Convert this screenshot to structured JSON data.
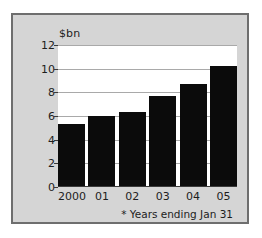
{
  "chart_data": {
    "type": "bar",
    "title": "",
    "subtitle": "",
    "xlabel": "",
    "ylabel": "$bn",
    "categories": [
      "2000",
      "01",
      "02",
      "03",
      "04",
      "05"
    ],
    "values": [
      5.3,
      6.0,
      6.3,
      7.7,
      8.7,
      10.2
    ],
    "series": [
      {
        "name": "",
        "values": [
          5.3,
          6.0,
          6.3,
          7.7,
          8.7,
          10.2
        ]
      }
    ],
    "ylim": [
      0,
      12
    ],
    "yticks": [
      0,
      2,
      4,
      6,
      8,
      10,
      12
    ],
    "ytick_labels": [
      "0",
      "2",
      "4",
      "6",
      "8",
      "10",
      "12"
    ],
    "grid": true,
    "legend": false,
    "legend_position": "none",
    "annotations": [
      "* Years ending Jan 31"
    ],
    "bar_color": "#0b0b0b",
    "plot_background": "#ffffff",
    "panel_background": "#d5d5d5",
    "border_color": "#6e6e6e",
    "gridline_color": "#a9a9a9",
    "axis_color": "#3a3a3a"
  },
  "footnote": "* Years ending Jan 31"
}
